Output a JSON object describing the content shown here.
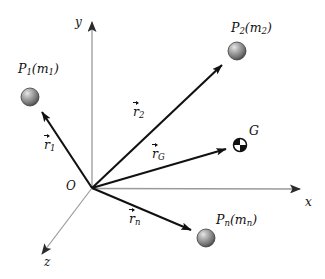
{
  "figure": {
    "background_color": "#ffffff",
    "axis_color": "#8a8a8a",
    "vector_color": "#111111",
    "sphere_color": "#8d8d8d"
  },
  "axes": [
    {
      "name": "y",
      "label": "y",
      "from": [
        92,
        188
      ],
      "to": [
        92,
        17
      ]
    },
    {
      "name": "x",
      "label": "x",
      "from": [
        92,
        188
      ],
      "to": [
        308,
        189
      ]
    },
    {
      "name": "z",
      "label": "z",
      "from": [
        92,
        188
      ],
      "to": [
        35,
        263
      ]
    }
  ],
  "origin": {
    "label": "O",
    "x": 92,
    "y": 188
  },
  "particles": [
    {
      "name": "P1",
      "label_p": "P",
      "label_sub": "1",
      "label_m": "m",
      "label_msub": "1",
      "label": "P₁(m₁)",
      "x": 30,
      "y": 97,
      "radius": 9
    },
    {
      "name": "P2",
      "label_p": "P",
      "label_sub": "2",
      "label_m": "m",
      "label_msub": "2",
      "label": "P₂(m₂)",
      "x": 237,
      "y": 51,
      "radius": 9
    },
    {
      "name": "Pn",
      "label_p": "P",
      "label_sub": "n",
      "label_m": "m",
      "label_msub": "n",
      "label": "Pₙ(mₙ)",
      "x": 206,
      "y": 238,
      "radius": 9
    }
  ],
  "center_of_mass": {
    "name": "G",
    "label": "G",
    "x": 240,
    "y": 145,
    "radius": 6.5,
    "symbol": "quartered-circle"
  },
  "vectors": [
    {
      "name": "r1",
      "label_r": "r",
      "label_sub": "1",
      "label": "r⃗₁",
      "from": [
        92,
        188
      ],
      "to": [
        38,
        106
      ]
    },
    {
      "name": "r2",
      "label_r": "r",
      "label_sub": "2",
      "label": "r⃗₂",
      "from": [
        92,
        188
      ],
      "to": [
        228,
        60
      ]
    },
    {
      "name": "rG",
      "label_r": "r",
      "label_sub": "G",
      "label": "r⃗_G",
      "from": [
        92,
        188
      ],
      "to": [
        231,
        148
      ]
    },
    {
      "name": "rn",
      "label_r": "r",
      "label_sub": "n",
      "label": "r⃗ₙ",
      "from": [
        92,
        188
      ],
      "to": [
        197,
        233
      ]
    }
  ]
}
